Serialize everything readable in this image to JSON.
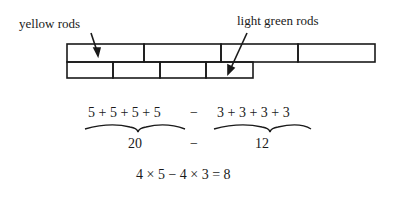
{
  "labels": {
    "yellow": "yellow rods",
    "green": "light green rods"
  },
  "rods": {
    "yellow": {
      "count": 4,
      "length_units": 5,
      "color_name": "yellow"
    },
    "light_green": {
      "count": 4,
      "length_units": 3,
      "color_name": "light green"
    }
  },
  "equation": {
    "left_sum": "5 + 5 + 5 + 5",
    "minus1": "−",
    "right_sum": "3 + 3 + 3 + 3",
    "left_total": "20",
    "minus2": "−",
    "right_total": "12",
    "final": "4 × 5 − 4 × 3 =  8"
  }
}
